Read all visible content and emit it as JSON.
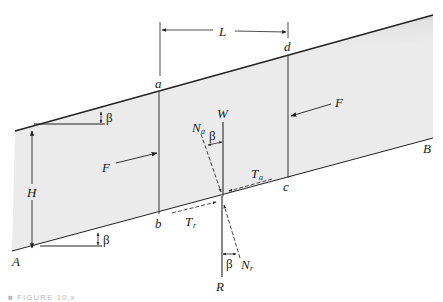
{
  "diagram": {
    "points": {
      "A": "A",
      "B": "B",
      "a": "a",
      "b": "b",
      "c": "c",
      "d": "d"
    },
    "dimensions": {
      "length": "L",
      "height": "H",
      "angle_top": "β",
      "angle_bottom": "β",
      "angle_W_Na": "β",
      "angle_R_Nr": "β"
    },
    "forces": {
      "side_left": "F",
      "side_right": "F",
      "weight": "W",
      "normal_active_main": "N",
      "normal_active_sub": "a",
      "tangential_active_main": "T",
      "tangential_active_sub": "a",
      "tangential_resisting_main": "T",
      "tangential_resisting_sub": "r",
      "normal_resisting_main": "N",
      "normal_resisting_sub": "r",
      "reaction": "R"
    },
    "colors": {
      "soil_fill": "#e8e8e8",
      "surface_shadow": "#5a5a5a",
      "line": "#333333"
    }
  },
  "caption": "■  FIGURE 10.x"
}
